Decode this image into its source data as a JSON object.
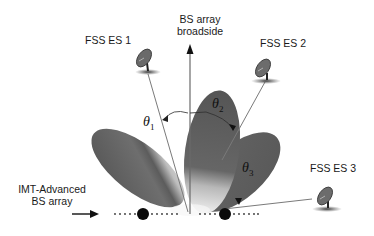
{
  "diagram": {
    "title": "",
    "labels": {
      "broadside_line1": "BS array",
      "broadside_line2": "broadside",
      "fss1": "FSS ES 1",
      "fss2": "FSS ES 2",
      "fss3": "FSS ES 3",
      "array_line1": "IMT-Advanced",
      "array_line2": "BS array"
    },
    "angles": [
      {
        "symbol": "θ",
        "sub": "1"
      },
      {
        "symbol": "θ",
        "sub": "2"
      },
      {
        "symbol": "θ",
        "sub": "3"
      }
    ],
    "nodes": [
      {
        "id": "fss-es-1",
        "type": "satellite-dish"
      },
      {
        "id": "fss-es-2",
        "type": "satellite-dish"
      },
      {
        "id": "fss-es-3",
        "type": "satellite-dish"
      },
      {
        "id": "bs-array",
        "type": "antenna-array",
        "elements": 2
      }
    ],
    "beams": [
      {
        "id": "beam-1",
        "target": "fss-es-1"
      },
      {
        "id": "beam-2",
        "target": "fss-es-2"
      },
      {
        "id": "beam-3",
        "target": "fss-es-3"
      }
    ],
    "colors": {
      "beam_dark": "#5a5a5a",
      "beam_light": "#d8d8d8",
      "line": "#777777",
      "arrow": "#111111"
    }
  }
}
